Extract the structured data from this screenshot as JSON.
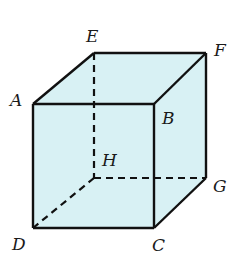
{
  "diagram": {
    "type": "cube",
    "fill_color": "#d8f1f4",
    "edge_color": "#111111",
    "vertices": {
      "A": {
        "label": "A",
        "x": 33,
        "y": 104
      },
      "B": {
        "label": "B",
        "x": 154,
        "y": 104
      },
      "C": {
        "label": "C",
        "x": 154,
        "y": 228
      },
      "D": {
        "label": "D",
        "x": 33,
        "y": 228
      },
      "E": {
        "label": "E",
        "x": 94,
        "y": 53
      },
      "F": {
        "label": "F",
        "x": 206,
        "y": 53
      },
      "G": {
        "label": "G",
        "x": 206,
        "y": 178
      },
      "H": {
        "label": "H",
        "x": 94,
        "y": 178
      }
    },
    "solid_edges": [
      "AB",
      "BC",
      "CD",
      "DA",
      "AE",
      "EF",
      "FB",
      "FG",
      "GC"
    ],
    "hidden_edges": [
      "EH",
      "HG",
      "HD"
    ]
  }
}
